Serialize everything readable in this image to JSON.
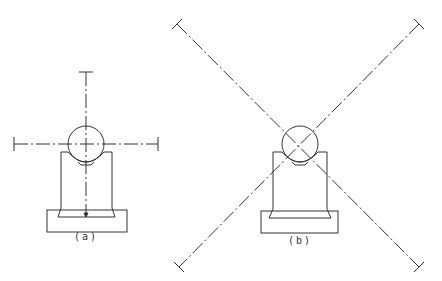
{
  "figures": [
    {
      "id": "a",
      "label": "(a)",
      "label_pos": [
        86,
        236
      ]
    },
    {
      "id": "b",
      "label": "(b)",
      "label_pos": [
        300,
        238
      ]
    }
  ],
  "colors": {
    "line": "#333333",
    "background": "#ffffff"
  }
}
